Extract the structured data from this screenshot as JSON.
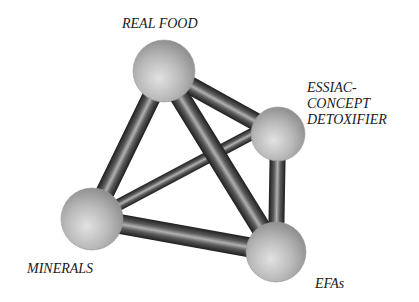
{
  "diagram": {
    "type": "tetrahedron-molecule",
    "nodes": [
      {
        "id": "real_food",
        "label": "REAL FOOD",
        "cx": 164,
        "cy": 71,
        "r": 31
      },
      {
        "id": "essiac",
        "label_lines": [
          "ESSIAC-",
          "CONCEPT",
          "DETOXIFIER"
        ],
        "cx": 278,
        "cy": 134,
        "r": 27
      },
      {
        "id": "minerals",
        "label": "MINERALS",
        "cx": 92,
        "cy": 219,
        "r": 31
      },
      {
        "id": "efas",
        "label": "EFAs",
        "cx": 276,
        "cy": 252,
        "r": 30
      }
    ],
    "edges": [
      {
        "from": "minerals",
        "to": "essiac",
        "layer": "back"
      },
      {
        "from": "real_food",
        "to": "essiac",
        "layer": "front"
      },
      {
        "from": "essiac",
        "to": "efas",
        "layer": "front"
      },
      {
        "from": "real_food",
        "to": "minerals",
        "layer": "front"
      },
      {
        "from": "minerals",
        "to": "efas",
        "layer": "front"
      },
      {
        "from": "real_food",
        "to": "efas",
        "layer": "front"
      }
    ],
    "colors": {
      "sphere_light": "#dcdcdc",
      "sphere_mid": "#b4b4b4",
      "sphere_dark": "#8a8a8a",
      "rod_dark": "#2a2a2a",
      "rod_light": "#a8a8a8",
      "label": "#1a1a1a"
    }
  },
  "labels": {
    "real_food": "REAL FOOD",
    "essiac_line1": "ESSIAC-",
    "essiac_line2": "CONCEPT",
    "essiac_line3": "DETOXIFIER",
    "minerals": "MINERALS",
    "efas": "EFAs"
  }
}
